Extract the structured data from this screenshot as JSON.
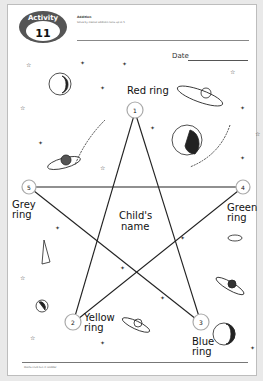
{
  "activity_badge": {
    "label": "Activity",
    "number": "11"
  },
  "header": {
    "topic": "Addition",
    "bullet": "Solve by mental addition facts up to 5"
  },
  "date": {
    "label": "Date"
  },
  "center": {
    "line1": "Child's",
    "line2": "name"
  },
  "rings": [
    {
      "number": "1",
      "label_line1": "Red ring",
      "label_line2": ""
    },
    {
      "number": "2",
      "label_line1": "Yellow",
      "label_line2": "ring"
    },
    {
      "number": "3",
      "label_line1": "Blue",
      "label_line2": "ring"
    },
    {
      "number": "4",
      "label_line1": "Green",
      "label_line2": "ring"
    },
    {
      "number": "5",
      "label_line1": "Grey",
      "label_line2": "ring"
    }
  ],
  "footer": {
    "text": "Maths Club Fun © Hodder"
  },
  "colors": {
    "line": "#222222",
    "ring": "#b0b0b0",
    "badge": "#444444"
  }
}
